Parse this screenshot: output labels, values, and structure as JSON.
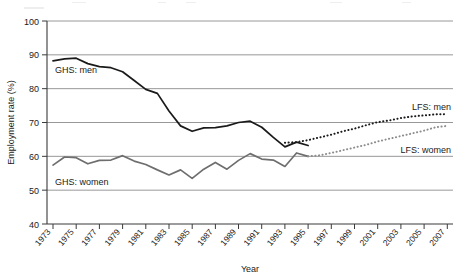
{
  "axes": {
    "ylabel": "Employment rate (%)",
    "xlabel": "Year",
    "yticks": [
      "100",
      "90",
      "80",
      "70",
      "60",
      "50",
      "40"
    ],
    "xticks": [
      "1973",
      "1975",
      "1977",
      "1979",
      "1981",
      "1983",
      "1985",
      "1987",
      "1989",
      "1991",
      "1993",
      "1995",
      "1997",
      "1999",
      "2001",
      "2003",
      "2005",
      "2007"
    ]
  },
  "labels": {
    "ghs_men": "GHS: men",
    "ghs_women": "GHS: women",
    "lfs_men": "LFS: men",
    "lfs_women": "LFS: women"
  },
  "colors": {
    "ghs_men": "#1a1a1a",
    "ghs_women": "#6e6e6e",
    "lfs_men": "#1a1a1a",
    "lfs_women": "#8d8d8d",
    "grid": "#8c8c8c",
    "axis": "#3a3a3a",
    "background": "#ffffff"
  },
  "chart_data": {
    "type": "line",
    "title": "",
    "xlabel": "Year",
    "ylabel": "Employment rate (%)",
    "xlim": [
      1973,
      2007
    ],
    "ylim": [
      40,
      100
    ],
    "ytick_step": 10,
    "xtick_step": 2,
    "grid": true,
    "legend": "inline-annotations",
    "series": [
      {
        "name": "GHS: men",
        "style": "solid",
        "color": "#1a1a1a",
        "x": [
          1973,
          1974,
          1975,
          1976,
          1977,
          1978,
          1979,
          1980,
          1981,
          1982,
          1983,
          1984,
          1985,
          1986,
          1987,
          1988,
          1989,
          1990,
          1991,
          1992,
          1993,
          1994,
          1995
        ],
        "values": [
          88.2,
          88.8,
          89.0,
          87.4,
          86.5,
          86.2,
          85.0,
          82.4,
          79.8,
          78.6,
          73.4,
          69.0,
          67.4,
          68.4,
          68.5,
          69.0,
          70.0,
          70.4,
          68.6,
          65.6,
          62.8,
          64.2,
          63.2
        ]
      },
      {
        "name": "GHS: women",
        "style": "solid",
        "color": "#6e6e6e",
        "x": [
          1973,
          1974,
          1975,
          1976,
          1977,
          1978,
          1979,
          1980,
          1981,
          1982,
          1983,
          1984,
          1985,
          1986,
          1987,
          1988,
          1989,
          1990,
          1991,
          1992,
          1993,
          1994,
          1995
        ],
        "values": [
          57.4,
          59.8,
          59.6,
          57.8,
          58.8,
          58.9,
          60.2,
          58.6,
          57.6,
          56.0,
          54.5,
          56.0,
          53.5,
          56.2,
          58.2,
          56.2,
          58.8,
          60.8,
          59.2,
          58.9,
          57.0,
          61.0,
          60.0
        ]
      },
      {
        "name": "LFS: men",
        "style": "dotted",
        "color": "#1a1a1a",
        "x": [
          1993,
          1994,
          1995,
          1996,
          1997,
          1998,
          1999,
          2000,
          2001,
          2002,
          2003,
          2004,
          2005,
          2006,
          2007
        ],
        "values": [
          64.0,
          64.2,
          64.8,
          65.6,
          66.4,
          67.4,
          68.2,
          69.2,
          70.1,
          70.6,
          71.3,
          71.8,
          72.1,
          72.4,
          72.5
        ]
      },
      {
        "name": "LFS: women",
        "style": "dotted",
        "color": "#8d8d8d",
        "x": [
          1995,
          1996,
          1997,
          1998,
          1999,
          2000,
          2001,
          2002,
          2003,
          2004,
          2005,
          2006,
          2007
        ],
        "values": [
          60.0,
          60.3,
          61.0,
          61.8,
          62.6,
          63.4,
          64.4,
          65.2,
          66.0,
          66.8,
          67.6,
          68.6,
          69.0
        ]
      }
    ]
  }
}
